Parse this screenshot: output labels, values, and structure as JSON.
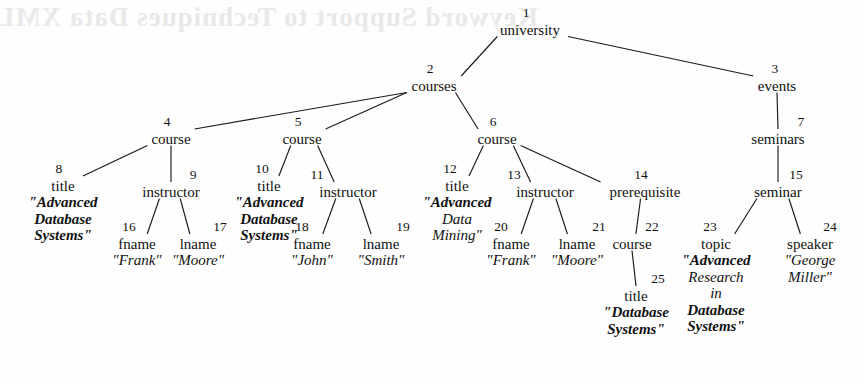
{
  "figure": {
    "type": "tree-diagram",
    "background_color": "#fefefe",
    "line_color": "#1a1a1a",
    "text_color": "#111111",
    "ghost_text": "Keyword Support to Techniques Data XML for"
  },
  "nodes": [
    {
      "id": "1",
      "label": "university",
      "x": 530,
      "y": 32,
      "value": null
    },
    {
      "id": "2",
      "label": "courses",
      "x": 434,
      "y": 88,
      "value": null
    },
    {
      "id": "3",
      "label": "events",
      "x": 777,
      "y": 88,
      "value": null
    },
    {
      "id": "4",
      "label": "course",
      "x": 171,
      "y": 141,
      "value": null
    },
    {
      "id": "5",
      "label": "course",
      "x": 302,
      "y": 141,
      "value": null
    },
    {
      "id": "6",
      "label": "course",
      "x": 497,
      "y": 141,
      "value": null
    },
    {
      "id": "7",
      "label": "seminars",
      "x": 778,
      "y": 141,
      "value": null
    },
    {
      "id": "8",
      "label": "title",
      "x": 63,
      "y": 188,
      "value": "\"Advanced Database Systems\""
    },
    {
      "id": "9",
      "label": "instructor",
      "x": 171,
      "y": 194,
      "value": null
    },
    {
      "id": "10",
      "label": "title",
      "x": 269,
      "y": 188,
      "value": "\"Advanced Database Systems\""
    },
    {
      "id": "11",
      "label": "instructor",
      "x": 348,
      "y": 194,
      "value": null
    },
    {
      "id": "12",
      "label": "title",
      "x": 457,
      "y": 188,
      "value": "\"Advanced Data Mining\""
    },
    {
      "id": "13",
      "label": "instructor",
      "x": 545,
      "y": 194,
      "value": null
    },
    {
      "id": "14",
      "label": "prerequisite",
      "x": 645,
      "y": 194,
      "value": null
    },
    {
      "id": "15",
      "label": "seminar",
      "x": 778,
      "y": 194,
      "value": null
    },
    {
      "id": "16",
      "label": "fname",
      "x": 137,
      "y": 246,
      "value": "\"Frank\""
    },
    {
      "id": "17",
      "label": "lname",
      "x": 198,
      "y": 246,
      "value": "\"Moore\""
    },
    {
      "id": "18",
      "label": "fname",
      "x": 312,
      "y": 246,
      "value": "\"John\""
    },
    {
      "id": "19",
      "label": "lname",
      "x": 381,
      "y": 246,
      "value": "\"Smith\""
    },
    {
      "id": "20",
      "label": "fname",
      "x": 511,
      "y": 246,
      "value": "\"Frank\""
    },
    {
      "id": "21",
      "label": "lname",
      "x": 577,
      "y": 246,
      "value": "\"Moore\""
    },
    {
      "id": "22",
      "label": "course",
      "x": 632,
      "y": 246,
      "value": null
    },
    {
      "id": "23",
      "label": "topic",
      "x": 716,
      "y": 246,
      "value": "\"Advanced Research in Database Systems\""
    },
    {
      "id": "24",
      "label": "speaker",
      "x": 810,
      "y": 246,
      "value": "\"George Miller\""
    },
    {
      "id": "25",
      "label": "title",
      "x": 636,
      "y": 298,
      "value": "\"Database Systems\""
    }
  ],
  "node_id_offsets": {
    "1": {
      "dx": -4,
      "dy": -15
    },
    "2": {
      "dx": -4,
      "dy": -15
    },
    "3": {
      "dx": -2,
      "dy": -15
    },
    "4": {
      "dx": -4,
      "dy": -15
    },
    "5": {
      "dx": -4,
      "dy": -15
    },
    "6": {
      "dx": -4,
      "dy": -15
    },
    "7": {
      "dx": 23,
      "dy": -15
    },
    "8": {
      "dx": -4,
      "dy": -15
    },
    "9": {
      "dx": 22,
      "dy": -15
    },
    "10": {
      "dx": -7,
      "dy": -15
    },
    "11": {
      "dx": -31,
      "dy": -15
    },
    "12": {
      "dx": -7,
      "dy": -15
    },
    "13": {
      "dx": -31,
      "dy": -15
    },
    "14": {
      "dx": -4,
      "dy": -15
    },
    "15": {
      "dx": 18,
      "dy": -15
    },
    "16": {
      "dx": -8,
      "dy": -15
    },
    "17": {
      "dx": 22,
      "dy": -15
    },
    "18": {
      "dx": -10,
      "dy": -15
    },
    "19": {
      "dx": 22,
      "dy": -15
    },
    "20": {
      "dx": -10,
      "dy": -15
    },
    "21": {
      "dx": 22,
      "dy": -15
    },
    "22": {
      "dx": 20,
      "dy": -15
    },
    "23": {
      "dx": -6,
      "dy": -15
    },
    "24": {
      "dx": 20,
      "dy": -15
    },
    "25": {
      "dx": 22,
      "dy": -15
    }
  },
  "value_styles": {
    "8": [
      {
        "t": "\"Advanced",
        "b": true
      },
      {
        "t": "Database",
        "b": true
      },
      {
        "t": "Systems\"",
        "b": true
      }
    ],
    "10": [
      {
        "t": "\"Advanced",
        "b": true
      },
      {
        "t": "Database",
        "b": true
      },
      {
        "t": "Systems\"",
        "b": true
      }
    ],
    "12": [
      {
        "t": "\"Advanced",
        "b": true
      },
      {
        "t": "Data",
        "b": false
      },
      {
        "t": "Mining\"",
        "b": false
      }
    ],
    "16": [
      {
        "t": "\"Frank\"",
        "b": false
      }
    ],
    "17": [
      {
        "t": "\"Moore\"",
        "b": false
      }
    ],
    "18": [
      {
        "t": "\"John\"",
        "b": false
      }
    ],
    "19": [
      {
        "t": "\"Smith\"",
        "b": false
      }
    ],
    "20": [
      {
        "t": "\"Frank\"",
        "b": false
      }
    ],
    "21": [
      {
        "t": "\"Moore\"",
        "b": false
      }
    ],
    "23": [
      {
        "t": "\"Advanced",
        "b": true
      },
      {
        "t": "Research",
        "b": false
      },
      {
        "t": "in",
        "b": false
      },
      {
        "t": "Database",
        "b": true
      },
      {
        "t": "Systems\"",
        "b": true
      }
    ],
    "24": [
      {
        "t": "\"George",
        "b": false
      },
      {
        "t": "Miller\"",
        "b": false
      }
    ],
    "25": [
      {
        "t": "\"Database",
        "b": true
      },
      {
        "t": "Systems\"",
        "b": true
      }
    ]
  },
  "edges": [
    {
      "from": "1",
      "to": "2"
    },
    {
      "from": "1",
      "to": "3"
    },
    {
      "from": "2",
      "to": "4"
    },
    {
      "from": "2",
      "to": "5"
    },
    {
      "from": "2",
      "to": "6"
    },
    {
      "from": "3",
      "to": "7"
    },
    {
      "from": "4",
      "to": "8"
    },
    {
      "from": "4",
      "to": "9"
    },
    {
      "from": "5",
      "to": "10"
    },
    {
      "from": "5",
      "to": "11"
    },
    {
      "from": "6",
      "to": "12"
    },
    {
      "from": "6",
      "to": "13"
    },
    {
      "from": "6",
      "to": "14"
    },
    {
      "from": "7",
      "to": "15"
    },
    {
      "from": "9",
      "to": "16"
    },
    {
      "from": "9",
      "to": "17"
    },
    {
      "from": "11",
      "to": "18"
    },
    {
      "from": "11",
      "to": "19"
    },
    {
      "from": "13",
      "to": "20"
    },
    {
      "from": "13",
      "to": "21"
    },
    {
      "from": "14",
      "to": "22"
    },
    {
      "from": "15",
      "to": "23"
    },
    {
      "from": "15",
      "to": "24"
    },
    {
      "from": "22",
      "to": "25"
    }
  ]
}
